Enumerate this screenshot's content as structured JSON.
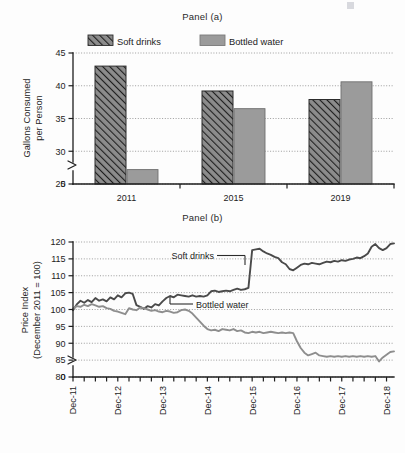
{
  "figure": {
    "background_color": "#fdfdfd",
    "soft_drinks_color": "#4a4a4a",
    "bottled_water_color": "#9b9b9b"
  },
  "panel_a": {
    "title": "Panel (a)",
    "legend": [
      {
        "label": "Soft drinks",
        "swatch": "hatched-swatch"
      },
      {
        "label": "Bottled water",
        "swatch": "solid-gray-swatch"
      }
    ],
    "chart_data": {
      "type": "bar",
      "title": "Panel (a)",
      "xlabel": "",
      "ylabel": "Gallons Consumed per Person",
      "categories": [
        "2011",
        "2015",
        "2019"
      ],
      "series": [
        {
          "name": "Soft drinks",
          "values": [
            43.0,
            39.2,
            37.9
          ]
        },
        {
          "name": "Bottled water",
          "values": [
            27.2,
            36.5,
            40.6
          ]
        }
      ],
      "ylim": [
        25,
        45
      ],
      "yticks": [
        0,
        25,
        30,
        35,
        40,
        45
      ],
      "ytick_labels": [
        "0",
        "25",
        "30",
        "35",
        "40",
        "45"
      ],
      "axis_break": true,
      "grid": true,
      "legend_position": "top"
    }
  },
  "panel_b": {
    "title": "Panel (b)",
    "annotations": [
      {
        "label": "Soft drinks"
      },
      {
        "label": "Bottled water"
      }
    ],
    "chart_data": {
      "type": "line",
      "title": "Panel (b)",
      "xlabel": "",
      "ylabel": "Price Index (December 2011 = 100)",
      "ylim": [
        80,
        120
      ],
      "yticks": [
        0,
        80,
        85,
        90,
        95,
        100,
        105,
        110,
        115,
        120
      ],
      "ytick_labels": [
        "0",
        "80",
        "85",
        "90",
        "95",
        "100",
        "105",
        "110",
        "115",
        "120"
      ],
      "axis_break": true,
      "grid": true,
      "xtick_labels": [
        "Dec-11",
        "Dec-12",
        "Dec-13",
        "Dec-14",
        "Dec-15",
        "Dec-16",
        "Dec-17",
        "Dec-18"
      ],
      "x_minor_ticks_per_year": 4,
      "x": [
        "Dec-11",
        "Jan-12",
        "Feb-12",
        "Mar-12",
        "Apr-12",
        "May-12",
        "Jun-12",
        "Jul-12",
        "Aug-12",
        "Sep-12",
        "Oct-12",
        "Nov-12",
        "Dec-12",
        "Jan-13",
        "Feb-13",
        "Mar-13",
        "Apr-13",
        "May-13",
        "Jun-13",
        "Jul-13",
        "Aug-13",
        "Sep-13",
        "Oct-13",
        "Nov-13",
        "Dec-13",
        "Jan-14",
        "Feb-14",
        "Mar-14",
        "Apr-14",
        "May-14",
        "Jun-14",
        "Jul-14",
        "Aug-14",
        "Sep-14",
        "Oct-14",
        "Nov-14",
        "Dec-14",
        "Jan-15",
        "Feb-15",
        "Mar-15",
        "Apr-15",
        "May-15",
        "Jun-15",
        "Jul-15",
        "Aug-15",
        "Sep-15",
        "Oct-15",
        "Nov-15",
        "Dec-15",
        "Jan-16",
        "Feb-16",
        "Mar-16",
        "Apr-16",
        "May-16",
        "Jun-16",
        "Jul-16",
        "Aug-16",
        "Sep-16",
        "Oct-16",
        "Nov-16",
        "Dec-16",
        "Jan-17",
        "Feb-17",
        "Mar-17",
        "Apr-17",
        "May-17",
        "Jun-17",
        "Jul-17",
        "Aug-17",
        "Sep-17",
        "Oct-17",
        "Nov-17",
        "Dec-17",
        "Jan-18",
        "Feb-18",
        "Mar-18",
        "Apr-18",
        "May-18",
        "Jun-18",
        "Jul-18",
        "Aug-18",
        "Sep-18",
        "Oct-18",
        "Nov-18",
        "Dec-18",
        "Jan-19",
        "Feb-19"
      ],
      "series": [
        {
          "name": "Soft drinks",
          "values": [
            99.8,
            101.5,
            102.6,
            102.0,
            102.8,
            102.2,
            103.4,
            102.6,
            103.0,
            102.4,
            103.6,
            103.0,
            104.2,
            103.6,
            104.8,
            105.0,
            104.6,
            101.3,
            100.8,
            100.2,
            101.0,
            100.6,
            101.6,
            101.2,
            102.4,
            103.4,
            104.0,
            103.6,
            104.4,
            104.2,
            104.0,
            103.8,
            104.2,
            103.8,
            104.0,
            103.8,
            104.2,
            105.4,
            105.6,
            105.2,
            105.4,
            105.6,
            105.4,
            105.8,
            106.2,
            105.8,
            106.0,
            106.4,
            117.6,
            117.8,
            118.0,
            117.2,
            116.6,
            116.2,
            115.6,
            115.2,
            114.0,
            113.4,
            112.0,
            111.6,
            112.4,
            113.2,
            113.6,
            113.4,
            113.8,
            113.6,
            113.4,
            113.8,
            114.2,
            114.0,
            114.4,
            114.2,
            114.6,
            114.4,
            114.8,
            115.0,
            115.4,
            115.2,
            115.8,
            116.6,
            118.6,
            119.4,
            118.2,
            117.6,
            118.2,
            119.4,
            119.6
          ]
        },
        {
          "name": "Bottled water",
          "values": [
            100.2,
            101.0,
            100.8,
            101.4,
            101.0,
            101.6,
            101.2,
            100.8,
            101.0,
            100.4,
            100.2,
            99.6,
            99.4,
            99.0,
            98.6,
            100.4,
            100.0,
            99.8,
            100.6,
            100.4,
            100.0,
            99.6,
            99.8,
            99.4,
            99.2,
            99.6,
            99.4,
            99.0,
            99.2,
            99.8,
            100.0,
            99.6,
            98.8,
            97.6,
            96.4,
            95.2,
            94.2,
            93.8,
            94.0,
            93.6,
            94.2,
            94.0,
            93.8,
            94.2,
            93.6,
            93.8,
            93.2,
            93.0,
            93.4,
            93.2,
            93.4,
            93.0,
            93.2,
            93.4,
            93.2,
            93.0,
            93.2,
            93.0,
            93.2,
            93.0,
            90.6,
            88.6,
            87.2,
            86.4,
            86.8,
            87.2,
            86.4,
            86.2,
            86.0,
            86.2,
            86.0,
            86.2,
            86.0,
            86.2,
            86.0,
            86.2,
            86.0,
            86.2,
            86.0,
            86.2,
            86.0,
            86.2,
            84.6,
            85.8,
            86.6,
            87.4,
            87.6
          ]
        }
      ]
    }
  }
}
